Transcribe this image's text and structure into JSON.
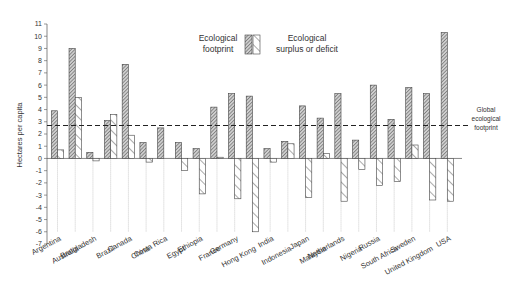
{
  "chart_data": {
    "type": "bar",
    "title": "",
    "xlabel": "",
    "ylabel": "Hectares per capita",
    "ylim": [
      -7,
      11
    ],
    "yticks": [
      11,
      10,
      9,
      8,
      7,
      6,
      5,
      4,
      3,
      2,
      1,
      0,
      -1,
      -2,
      -3,
      -4,
      -5,
      -6,
      -7
    ],
    "grid": false,
    "legend_position": "top-center",
    "categories": [
      "Argentina",
      "Australia",
      "Bangladesh",
      "Brazil",
      "Canada",
      "China",
      "Costa Rica",
      "Egypt",
      "Ethiopia",
      "France",
      "Germany",
      "Hong Kong",
      "India",
      "Indonesia",
      "Japan",
      "Malaysia",
      "Netherlands",
      "Nigeria",
      "Russia",
      "South Africa",
      "Sweden",
      "United Kingdom",
      "USA"
    ],
    "series": [
      {
        "name": "Ecological footprint",
        "pattern": "dense-hatch",
        "values": [
          3.9,
          9.0,
          0.5,
          3.1,
          7.7,
          1.3,
          2.5,
          1.3,
          0.8,
          4.2,
          5.3,
          5.1,
          0.8,
          1.4,
          4.3,
          3.3,
          5.3,
          1.5,
          6.0,
          3.2,
          5.8,
          5.3,
          10.3
        ]
      },
      {
        "name": "Ecological surplus or deficit",
        "pattern": "sparse-diagonal-hatch",
        "values": [
          0.7,
          5.0,
          -0.2,
          3.6,
          1.9,
          -0.3,
          0.0,
          -1.0,
          -2.9,
          0.1,
          -3.3,
          -6.0,
          -0.3,
          1.2,
          -3.2,
          0.4,
          -3.5,
          -0.9,
          -2.2,
          -1.9,
          1.1,
          -3.4,
          -3.5
        ]
      }
    ],
    "reference_lines": [
      {
        "label": "Global ecological footprint",
        "value": 2.7,
        "style": "dashed"
      }
    ]
  },
  "legend": {
    "footprint_line1": "Ecological",
    "footprint_line2": "footprint",
    "surplus_line1": "Ecological",
    "surplus_line2": "surplus or deficit"
  },
  "annotation": {
    "line1": "Global",
    "line2": "ecological",
    "line3": "footprint"
  },
  "axis": {
    "ylabel": "Hectares per capita"
  }
}
